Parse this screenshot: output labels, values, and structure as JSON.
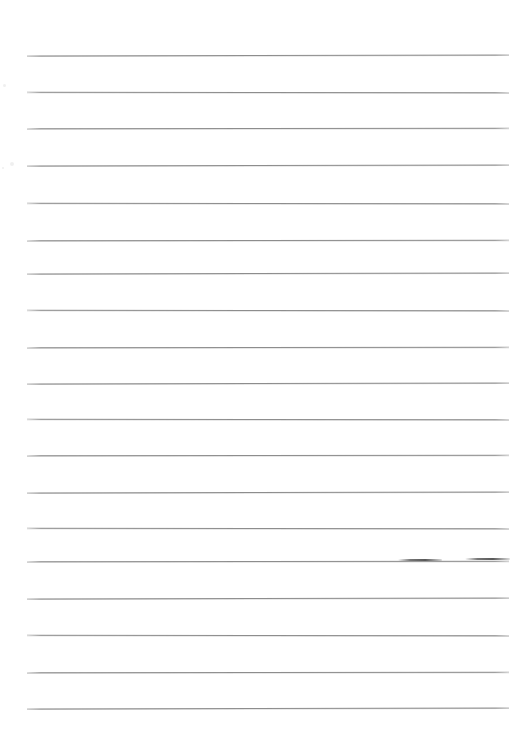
{
  "document": {
    "kind": "scanned-lined-paper",
    "title": "Blank ruled notebook page",
    "page_width": 528,
    "page_height": 734,
    "background_color": "#ffffff",
    "rule_color": "#8d8d8d",
    "content_text": "",
    "written_text": "",
    "ruling": {
      "line_count": 19,
      "first_line_y": 55,
      "line_spacing": 36.4,
      "line_left_x": 27,
      "line_right_x": 509,
      "line_thickness": 1,
      "top_margin": 55,
      "bottom_margin": 24,
      "left_margin": 27,
      "right_margin": 19
    },
    "lines": [
      {
        "id": "rule-1",
        "y": 55,
        "x1": 27,
        "x2": 509
      },
      {
        "id": "rule-2",
        "y": 92,
        "x1": 27,
        "x2": 509
      },
      {
        "id": "rule-3",
        "y": 128,
        "x1": 27,
        "x2": 509
      },
      {
        "id": "rule-4",
        "y": 165,
        "x1": 27,
        "x2": 509
      },
      {
        "id": "rule-5",
        "y": 203,
        "x1": 27,
        "x2": 509
      },
      {
        "id": "rule-6",
        "y": 240,
        "x1": 27,
        "x2": 509
      },
      {
        "id": "rule-7",
        "y": 273,
        "x1": 27,
        "x2": 509
      },
      {
        "id": "rule-8",
        "y": 310,
        "x1": 27,
        "x2": 509
      },
      {
        "id": "rule-9",
        "y": 347,
        "x1": 27,
        "x2": 509
      },
      {
        "id": "rule-10",
        "y": 383,
        "x1": 27,
        "x2": 509
      },
      {
        "id": "rule-11",
        "y": 419,
        "x1": 27,
        "x2": 509
      },
      {
        "id": "rule-12",
        "y": 455,
        "x1": 27,
        "x2": 509
      },
      {
        "id": "rule-13",
        "y": 492,
        "x1": 27,
        "x2": 509
      },
      {
        "id": "rule-14",
        "y": 528,
        "x1": 27,
        "x2": 509
      },
      {
        "id": "rule-15",
        "y": 561,
        "x1": 27,
        "x2": 509
      },
      {
        "id": "rule-16",
        "y": 598,
        "x1": 27,
        "x2": 509
      },
      {
        "id": "rule-17",
        "y": 635,
        "x1": 27,
        "x2": 509
      },
      {
        "id": "rule-18",
        "y": 672,
        "x1": 27,
        "x2": 509
      },
      {
        "id": "rule-19",
        "y": 708,
        "x1": 27,
        "x2": 509
      }
    ],
    "marks": [
      {
        "id": "mark-1",
        "x": 398,
        "y": 559,
        "width": 44,
        "note": "darker overstroke on rule-15"
      },
      {
        "id": "mark-2",
        "x": 465,
        "y": 558,
        "width": 45,
        "note": "short darker stroke near right margin"
      }
    ],
    "specks": [
      {
        "id": "speck-1",
        "x": 3,
        "y": 84,
        "size": 3
      },
      {
        "id": "speck-2",
        "x": 10,
        "y": 162,
        "size": 4
      },
      {
        "id": "speck-3",
        "x": 2,
        "y": 167,
        "size": 2
      }
    ]
  }
}
